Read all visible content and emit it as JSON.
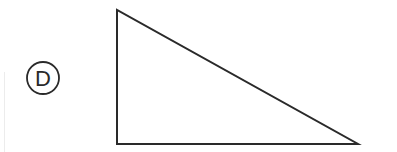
{
  "diagram": {
    "label": "D",
    "label_circle": {
      "cx": 43,
      "cy": 78,
      "r": 16
    },
    "triangle": {
      "points": [
        [
          117,
          10
        ],
        [
          117,
          144
        ],
        [
          358,
          144
        ]
      ],
      "stroke": "#2a2a2a",
      "stroke_width": 2,
      "fill": "none"
    },
    "colors": {
      "background": "#ffffff",
      "ink": "#2a2a2a"
    }
  }
}
